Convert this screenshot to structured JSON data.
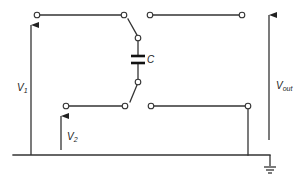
{
  "diagram": {
    "type": "circuit-schematic",
    "labels": {
      "capacitor": "C",
      "v1_main": "V",
      "v1_sub": "1",
      "v2_main": "V",
      "v2_sub": "2",
      "vout_main": "V",
      "vout_sub": "out"
    },
    "components": [
      {
        "id": "capacitor",
        "label": "C"
      },
      {
        "id": "switch-top",
        "type": "SPDT"
      },
      {
        "id": "switch-bottom",
        "type": "SPDT"
      },
      {
        "id": "ground",
        "type": "ground-symbol"
      }
    ],
    "voltages": [
      {
        "id": "V1",
        "direction": "up"
      },
      {
        "id": "V2",
        "direction": "up"
      },
      {
        "id": "Vout",
        "direction": "up"
      }
    ],
    "colors": {
      "wire": "#333333",
      "background": "#ffffff"
    }
  }
}
